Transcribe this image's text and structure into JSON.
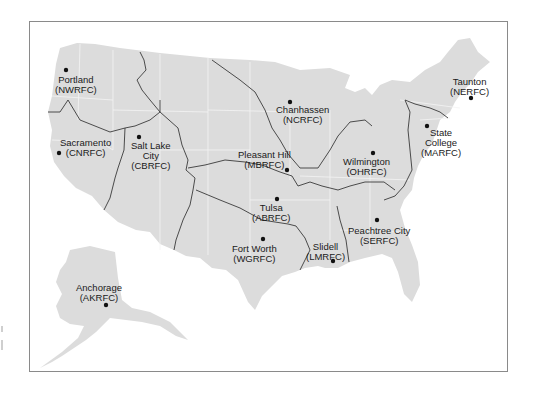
{
  "map": {
    "title": "NWS River Forecast Centers",
    "colors": {
      "land": "#dcdcdc",
      "basin_boundary": "#3a3a3a",
      "state_boundary": "#f4f4f4",
      "frame": "#8a8a8a",
      "marker": "#111111"
    },
    "centers": [
      {
        "id": "nwrfc",
        "city": "Portland",
        "code": "(NWRFC)",
        "dot": [
          66,
          70
        ],
        "label_pos": [
          55,
          78
        ]
      },
      {
        "id": "cnrfc",
        "city": "Sacramento",
        "code": "(CNRFC)",
        "dot": [
          59,
          153
        ],
        "label_pos": [
          60,
          140
        ]
      },
      {
        "id": "cbrfc",
        "city": "Salt Lake City",
        "code": "(CBRFC)",
        "dot": [
          139,
          137
        ],
        "label_pos": [
          130,
          143
        ]
      },
      {
        "id": "ncrfc",
        "city": "Chanhassen",
        "code": "(NCRFC)",
        "dot": [
          290,
          102
        ],
        "label_pos": [
          273,
          107
        ]
      },
      {
        "id": "mbrfc",
        "city": "Pleasant Hill",
        "code": "(MBRFC)",
        "dot": [
          287,
          170
        ],
        "label_pos": [
          238,
          150
        ]
      },
      {
        "id": "ohrfc",
        "city": "Wilmington",
        "code": "(OHRFC)",
        "dot": [
          373,
          153
        ],
        "label_pos": [
          344,
          158
        ]
      },
      {
        "id": "marfc",
        "city": "State College",
        "code": "(MARFC)",
        "dot": [
          427,
          126
        ],
        "label_pos": [
          418,
          129
        ]
      },
      {
        "id": "nerfc",
        "city": "Taunton",
        "code": "(NERFC)",
        "dot": [
          471,
          98
        ],
        "label_pos": [
          450,
          78
        ]
      },
      {
        "id": "abrfc",
        "city": "Tulsa",
        "code": "(ABRFC)",
        "dot": [
          277,
          199
        ],
        "label_pos": [
          248,
          202
        ]
      },
      {
        "id": "wgrfc",
        "city": "Fort Worth",
        "code": "(WGRFC)",
        "dot": [
          263,
          239
        ],
        "label_pos": [
          232,
          245
        ]
      },
      {
        "id": "lmrfc",
        "city": "Slidell",
        "code": "(LMRFC)",
        "dot": [
          333,
          261
        ],
        "label_pos": [
          307,
          243
        ]
      },
      {
        "id": "serfc",
        "city": "Peachtree City",
        "code": "(SERFC)",
        "dot": [
          377,
          220
        ],
        "label_pos": [
          348,
          225
        ]
      },
      {
        "id": "akrfc",
        "city": "Anchorage",
        "code": "(AKRFC)",
        "dot": [
          106,
          305
        ],
        "label_pos": [
          76,
          285
        ]
      }
    ]
  }
}
